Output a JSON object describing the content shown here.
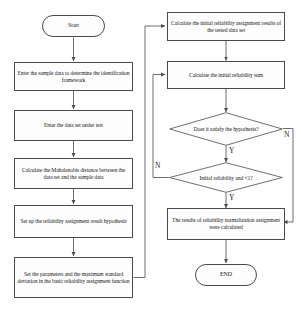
{
  "diagram": {
    "type": "flowchart",
    "nodes": {
      "start": {
        "label": "Start",
        "shape": "terminator"
      },
      "sample_data": {
        "label": "Enter the sample data to determine the identification framework",
        "shape": "process"
      },
      "data_set": {
        "label": "Enter the data set under test",
        "shape": "process"
      },
      "mahalanobis": {
        "label": "Calculate the Mahalanobis distance between the data set and the sample data",
        "shape": "process"
      },
      "hypothesis_setup": {
        "label": "Set up the reliability assignment result hypothesis",
        "shape": "process"
      },
      "parameters": {
        "label": "Set the parameters and the maximum standard deviation in the basic reliability assignment function",
        "shape": "process"
      },
      "initial_assignment": {
        "label": "Calculate the initial reliability assignment results of the tested data set",
        "shape": "process"
      },
      "initial_sum": {
        "label": "Calculate the initial reliability sum",
        "shape": "process"
      },
      "decision_hypothesis": {
        "label": "Does it satisfy the hypothesis?",
        "shape": "decision"
      },
      "decision_reliability": {
        "label": "Initial reliability and <1?",
        "shape": "decision"
      },
      "normalization": {
        "label": "The results of reliability normalization assignment were calculated",
        "shape": "process"
      },
      "end": {
        "label": "END",
        "shape": "terminator"
      }
    },
    "branch_labels": {
      "hypothesis_no": "N",
      "hypothesis_yes": "Y",
      "reliability_no": "N",
      "reliability_yes": "Y"
    },
    "colors": {
      "stroke": "#4a4a4a",
      "text": "#1a1a1a",
      "background": "#ffffff"
    }
  }
}
